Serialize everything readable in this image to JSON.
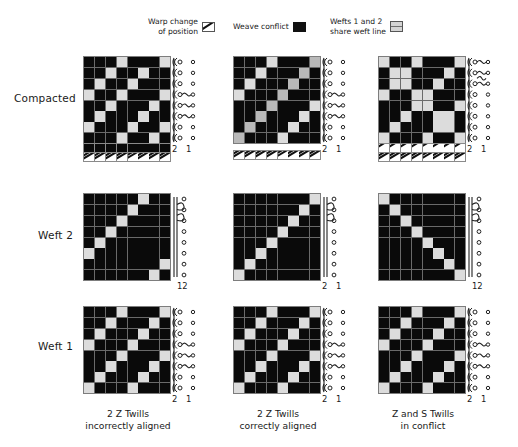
{
  "legend": {
    "items": [
      {
        "label": "Warp change\nof position",
        "icon": "hatched-swatch",
        "color": "#ffffff"
      },
      {
        "label": "Weave conflict",
        "icon": "black-swatch",
        "color": "#111111"
      },
      {
        "label": "Wefts 1 and 2\nshare weft line",
        "icon": "gray-split-swatch",
        "color": "#d4d4d4"
      }
    ]
  },
  "rows": [
    {
      "label": "Compacted"
    },
    {
      "label": "Weft 2"
    },
    {
      "label": "Weft 1"
    }
  ],
  "columns": [
    {
      "caption": "2 Z Twills\nincorrectly aligned"
    },
    {
      "caption": "2 Z Twills\ncorrectly aligned"
    },
    {
      "caption": "Z and S Twills\nin conflict"
    }
  ],
  "draft_labels": {
    "two_one": "2  1",
    "twelve": "12"
  },
  "colors": {
    "warp_down": "#0a0a0a",
    "warp_up": "#dcdcdc",
    "shared": "#b9b9b9",
    "grid_line": "#6a6a6a",
    "background": "#ffffff"
  },
  "chart_data": {
    "type": "heatmap",
    "grid_size": 8,
    "cells": {
      "r0c0": [
        [
          0,
          0,
          0,
          1,
          0,
          0,
          0,
          1
        ],
        [
          0,
          0,
          1,
          0,
          0,
          1,
          0,
          0
        ],
        [
          0,
          1,
          0,
          0,
          1,
          0,
          0,
          0
        ],
        [
          1,
          0,
          0,
          1,
          0,
          0,
          0,
          1
        ],
        [
          0,
          0,
          1,
          0,
          0,
          0,
          1,
          0
        ],
        [
          0,
          1,
          0,
          0,
          0,
          1,
          0,
          0
        ],
        [
          1,
          0,
          0,
          0,
          1,
          0,
          0,
          1
        ],
        [
          0,
          0,
          0,
          1,
          0,
          0,
          1,
          0
        ]
      ],
      "r0c1": [
        [
          0,
          0,
          0,
          1,
          0,
          0,
          0,
          2
        ],
        [
          0,
          0,
          1,
          0,
          0,
          0,
          2,
          0
        ],
        [
          0,
          1,
          0,
          0,
          0,
          2,
          0,
          0
        ],
        [
          1,
          0,
          0,
          0,
          2,
          0,
          0,
          0
        ],
        [
          0,
          0,
          0,
          2,
          0,
          0,
          0,
          1
        ],
        [
          0,
          0,
          2,
          0,
          0,
          0,
          1,
          0
        ],
        [
          0,
          2,
          0,
          0,
          0,
          1,
          0,
          0
        ],
        [
          2,
          0,
          0,
          0,
          1,
          0,
          0,
          0
        ]
      ],
      "r0c2": [
        [
          1,
          0,
          0,
          1,
          0,
          0,
          0,
          1
        ],
        [
          0,
          1,
          1,
          0,
          0,
          0,
          1,
          0
        ],
        [
          0,
          1,
          1,
          0,
          0,
          1,
          0,
          0
        ],
        [
          1,
          0,
          0,
          1,
          1,
          0,
          0,
          0
        ],
        [
          0,
          0,
          0,
          1,
          1,
          0,
          0,
          1
        ],
        [
          0,
          0,
          1,
          0,
          0,
          1,
          1,
          0
        ],
        [
          0,
          1,
          0,
          0,
          0,
          1,
          1,
          0
        ],
        [
          1,
          0,
          0,
          0,
          1,
          0,
          0,
          1
        ]
      ],
      "r1c0": [
        [
          0,
          0,
          0,
          0,
          0,
          1,
          0,
          0
        ],
        [
          0,
          0,
          0,
          0,
          1,
          0,
          0,
          0
        ],
        [
          0,
          0,
          0,
          1,
          0,
          0,
          0,
          0
        ],
        [
          0,
          0,
          1,
          0,
          0,
          0,
          0,
          0
        ],
        [
          0,
          1,
          0,
          0,
          0,
          0,
          0,
          0
        ],
        [
          1,
          0,
          0,
          0,
          0,
          0,
          0,
          0
        ],
        [
          0,
          0,
          0,
          0,
          0,
          0,
          0,
          1
        ],
        [
          0,
          0,
          0,
          0,
          0,
          0,
          1,
          0
        ]
      ],
      "r1c1": [
        [
          0,
          0,
          0,
          0,
          0,
          0,
          0,
          1
        ],
        [
          0,
          0,
          0,
          0,
          0,
          0,
          1,
          0
        ],
        [
          0,
          0,
          0,
          0,
          0,
          1,
          0,
          0
        ],
        [
          0,
          0,
          0,
          0,
          1,
          0,
          0,
          0
        ],
        [
          0,
          0,
          0,
          1,
          0,
          0,
          0,
          0
        ],
        [
          0,
          0,
          1,
          0,
          0,
          0,
          0,
          0
        ],
        [
          0,
          1,
          0,
          0,
          0,
          0,
          0,
          0
        ],
        [
          1,
          0,
          0,
          0,
          0,
          0,
          0,
          0
        ]
      ],
      "r1c2": [
        [
          1,
          0,
          0,
          0,
          0,
          0,
          0,
          0
        ],
        [
          0,
          1,
          0,
          0,
          0,
          0,
          0,
          0
        ],
        [
          0,
          0,
          1,
          0,
          0,
          0,
          0,
          0
        ],
        [
          0,
          0,
          0,
          1,
          0,
          0,
          0,
          0
        ],
        [
          0,
          0,
          0,
          0,
          1,
          0,
          0,
          0
        ],
        [
          0,
          0,
          0,
          0,
          0,
          1,
          0,
          0
        ],
        [
          0,
          0,
          0,
          0,
          0,
          0,
          1,
          0
        ],
        [
          0,
          0,
          0,
          0,
          0,
          0,
          0,
          1
        ]
      ],
      "r2c0": [
        [
          0,
          0,
          0,
          1,
          0,
          0,
          0,
          1
        ],
        [
          0,
          0,
          1,
          0,
          0,
          0,
          1,
          0
        ],
        [
          0,
          1,
          0,
          0,
          0,
          1,
          0,
          0
        ],
        [
          1,
          0,
          0,
          0,
          1,
          0,
          0,
          0
        ],
        [
          0,
          0,
          0,
          1,
          0,
          0,
          0,
          1
        ],
        [
          0,
          0,
          1,
          0,
          0,
          0,
          1,
          0
        ],
        [
          0,
          1,
          0,
          0,
          0,
          1,
          0,
          0
        ],
        [
          1,
          0,
          0,
          0,
          1,
          0,
          0,
          0
        ]
      ],
      "r2c1": [
        [
          0,
          0,
          0,
          1,
          0,
          0,
          0,
          1
        ],
        [
          0,
          0,
          1,
          0,
          0,
          0,
          1,
          0
        ],
        [
          0,
          1,
          0,
          0,
          0,
          1,
          0,
          0
        ],
        [
          1,
          0,
          0,
          0,
          1,
          0,
          0,
          0
        ],
        [
          0,
          0,
          0,
          1,
          0,
          0,
          0,
          1
        ],
        [
          0,
          0,
          1,
          0,
          0,
          0,
          1,
          0
        ],
        [
          0,
          1,
          0,
          0,
          0,
          1,
          0,
          0
        ],
        [
          1,
          0,
          0,
          0,
          1,
          0,
          0,
          0
        ]
      ],
      "r2c2": [
        [
          0,
          0,
          0,
          1,
          0,
          0,
          0,
          1
        ],
        [
          0,
          0,
          1,
          0,
          0,
          0,
          1,
          0
        ],
        [
          0,
          1,
          0,
          0,
          0,
          1,
          0,
          0
        ],
        [
          1,
          0,
          0,
          0,
          1,
          0,
          0,
          0
        ],
        [
          0,
          0,
          0,
          1,
          0,
          0,
          0,
          1
        ],
        [
          0,
          0,
          1,
          0,
          0,
          0,
          1,
          0
        ],
        [
          0,
          1,
          0,
          0,
          0,
          1,
          0,
          0
        ],
        [
          1,
          0,
          0,
          0,
          1,
          0,
          0,
          0
        ]
      ]
    },
    "hatch_strips": {
      "r0c0": {
        "top": [
          0,
          0,
          0,
          0,
          0,
          0,
          0,
          0
        ],
        "bottom": [
          1,
          1,
          1,
          1,
          1,
          1,
          1,
          1
        ]
      },
      "r0c1": {
        "top": null,
        "bottom": [
          1,
          1,
          1,
          1,
          1,
          1,
          1,
          1
        ]
      },
      "r0c2": {
        "top": [
          3,
          3,
          3,
          3,
          3,
          3,
          3,
          3
        ],
        "bottom": [
          1,
          1,
          1,
          1,
          1,
          1,
          1,
          1
        ]
      }
    }
  }
}
